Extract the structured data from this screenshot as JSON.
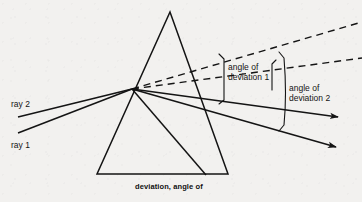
{
  "figure": {
    "title": "deviation, angle of",
    "background_color": "#f2f1ef",
    "ink_color": "#141414",
    "width": 362,
    "height": 202
  },
  "labels": {
    "ray_1": "ray 1",
    "ray_2": "ray 2",
    "angle_of_deviation_1_line1": "angle of",
    "angle_of_deviation_1_line2": "deviation 1",
    "angle_of_deviation_2_line1": "angle of",
    "angle_of_deviation_2_line2": "deviation 2"
  },
  "diagram_data": {
    "type": "optics-ray-diagram",
    "subject": "Refraction and dispersion of two incident rays through a triangular glass prism",
    "prism": {
      "shape": "triangle",
      "apex": [
        170,
        12
      ],
      "base_left": [
        97,
        174
      ],
      "base_right": [
        228,
        174
      ]
    },
    "incidence_point": [
      132,
      89
    ],
    "rays": [
      {
        "name": "ray 2",
        "role": "incident-upper",
        "start": [
          18,
          117
        ],
        "end": [
          132,
          89
        ],
        "style": "solid"
      },
      {
        "name": "ray 1",
        "role": "incident-lower",
        "start": [
          18,
          133
        ],
        "end": [
          132,
          89
        ],
        "style": "solid"
      }
    ],
    "emergent_rays": [
      {
        "name": "emergent ray 1",
        "from": [
          132,
          89
        ],
        "to": [
          340,
          117
        ],
        "style": "solid",
        "arrowhead": true
      },
      {
        "name": "emergent ray 2",
        "from": [
          132,
          89
        ],
        "to": [
          338,
          147
        ],
        "style": "solid",
        "arrowhead": true
      }
    ],
    "undeviated_extensions": [
      {
        "name": "extension of ray 2",
        "from": [
          132,
          89
        ],
        "to": [
          362,
          22
        ],
        "style": "dashed"
      },
      {
        "name": "extension of ray 1",
        "from": [
          132,
          89
        ],
        "to": [
          362,
          58
        ],
        "style": "dashed"
      }
    ],
    "internal_ray": {
      "from": [
        132,
        89
      ],
      "to": [
        205,
        174
      ],
      "style": "solid"
    },
    "angle_markers": [
      {
        "label": "angle of deviation 1",
        "between": [
          "extension of ray 2",
          "emergent ray 1"
        ],
        "arc_x": 224,
        "arc_top_y": 58,
        "arc_bottom_y": 100
      },
      {
        "label": "angle of deviation 2",
        "between": [
          "extension of ray 1",
          "emergent ray 2"
        ],
        "arc_x": 284,
        "arc_top_y": 57,
        "arc_bottom_y": 129
      }
    ]
  }
}
